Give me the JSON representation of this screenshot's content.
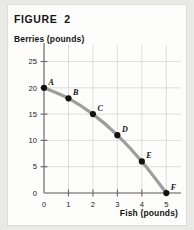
{
  "figure": {
    "title": "FIGURE  2"
  },
  "chart_data": {
    "type": "line",
    "title": "FIGURE  2",
    "xlabel": "Fish (pounds)",
    "ylabel": "Berries (pounds)",
    "xlim": [
      0,
      5.6
    ],
    "ylim": [
      0,
      27
    ],
    "grid": true,
    "legend": null,
    "x_ticks": [
      "0",
      "1",
      "2",
      "3",
      "4",
      "5"
    ],
    "x_tick_values": [
      0,
      1,
      2,
      3,
      4,
      5
    ],
    "y_ticks": [
      "0",
      "5",
      "10",
      "15",
      "20",
      "25"
    ],
    "y_tick_values": [
      0,
      5,
      10,
      15,
      20,
      25
    ],
    "series": [
      {
        "name": "Production possibilities frontier",
        "x": [
          0,
          1,
          2,
          3,
          4,
          5
        ],
        "values": [
          20,
          18,
          15,
          11,
          6,
          0
        ],
        "point_labels": [
          "A",
          "B",
          "C",
          "D",
          "E",
          "F"
        ],
        "color": "#9d9d9b",
        "marker_color": "#121212"
      }
    ],
    "points": [
      {
        "label": "A",
        "x": 0,
        "y": 20
      },
      {
        "label": "B",
        "x": 1,
        "y": 18
      },
      {
        "label": "C",
        "x": 2,
        "y": 15
      },
      {
        "label": "D",
        "x": 3,
        "y": 11
      },
      {
        "label": "E",
        "x": 4,
        "y": 6
      },
      {
        "label": "F",
        "x": 5,
        "y": 0
      }
    ],
    "colors": {
      "curve": "#9d9d9b",
      "marker": "#121212",
      "grid": "#d5d5d3",
      "axis": "#8e8e8c",
      "card_background": "#fdfdfb",
      "page_background": "#e9e9e6",
      "text": "#151515"
    }
  }
}
